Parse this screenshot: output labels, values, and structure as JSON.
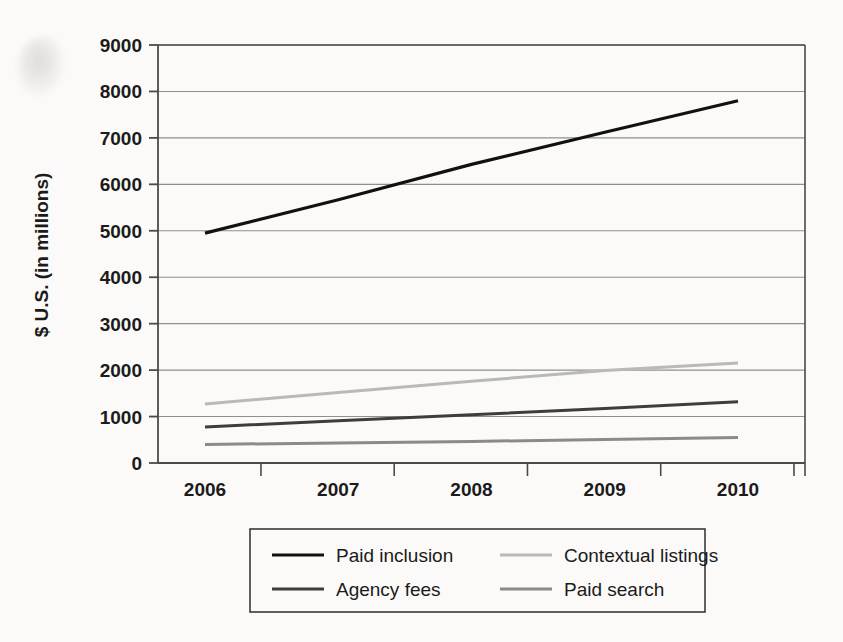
{
  "chart_data": {
    "type": "line",
    "title": "",
    "subtitle": "",
    "xlabel": "",
    "ylabel": "$ U.S. (in millions)",
    "categories": [
      "2006",
      "2007",
      "2008",
      "2009",
      "2010"
    ],
    "x": [
      2006,
      2007,
      2008,
      2009,
      2010
    ],
    "xlim": [
      2006,
      2010
    ],
    "ylim": [
      0,
      9000
    ],
    "yticks": [
      0,
      1000,
      2000,
      3000,
      4000,
      5000,
      6000,
      7000,
      8000,
      9000
    ],
    "ytick_labels": [
      "0",
      "1000",
      "2000",
      "3000",
      "4000",
      "5000",
      "6000",
      "7000",
      "8000",
      "9000"
    ],
    "grid": "horizontal",
    "legend_position": "bottom",
    "series": [
      {
        "name": "Paid inclusion",
        "values": [
          4950,
          5670,
          6430,
          7120,
          7800
        ],
        "color": "#111111",
        "width": 3.2
      },
      {
        "name": "Contextual listings",
        "values": [
          1270,
          1520,
          1760,
          1990,
          2150
        ],
        "color": "#b9b9b9",
        "width": 3.0
      },
      {
        "name": "Agency fees",
        "values": [
          775,
          910,
          1040,
          1175,
          1320
        ],
        "color": "#3d3d3d",
        "width": 3.0
      },
      {
        "name": "Paid search",
        "values": [
          400,
          430,
          465,
          505,
          550
        ],
        "color": "#8a8a8a",
        "width": 3.0
      }
    ]
  },
  "legend": {
    "entries": [
      {
        "label": "Paid inclusion",
        "color": "#111111",
        "width": 3.2
      },
      {
        "label": "Contextual listings",
        "color": "#b9b9b9",
        "width": 3.0
      },
      {
        "label": "Agency fees",
        "color": "#3d3d3d",
        "width": 3.0
      },
      {
        "label": "Paid search",
        "color": "#8a8a8a",
        "width": 3.0
      }
    ]
  },
  "style": {
    "background": "#fbfaf8",
    "axis_color": "#4a4a4a",
    "grid_color": "#8f8f8f",
    "text_color": "#1b1b1b"
  }
}
